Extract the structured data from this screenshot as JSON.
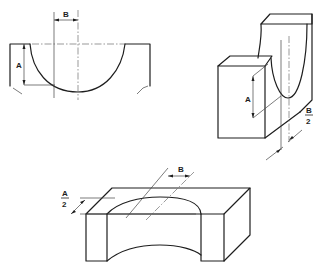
{
  "figures": [
    {
      "name": "front-view-semicircular-notch",
      "dimensions": [
        {
          "label": "B",
          "meaning": "horizontal offset from centerline"
        },
        {
          "label": "A",
          "meaning": "vertical depth"
        }
      ]
    },
    {
      "name": "isometric-side-slot",
      "dimensions": [
        {
          "label": "A",
          "meaning": "vertical depth"
        },
        {
          "label_num": "B",
          "label_den": "2",
          "meaning": "half offset"
        }
      ]
    },
    {
      "name": "isometric-saddle-block",
      "dimensions": [
        {
          "label": "B",
          "meaning": "offset"
        },
        {
          "label_num": "A",
          "label_den": "2",
          "meaning": "half depth"
        }
      ]
    }
  ],
  "colors": {
    "line": "#1e1e1e",
    "background": "#ffffff"
  }
}
